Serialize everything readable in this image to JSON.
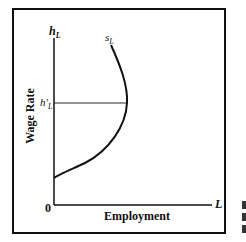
{
  "diagram": {
    "y_axis": {
      "symbol": "h",
      "subscript": "L",
      "label": "Wage Rate"
    },
    "x_axis": {
      "symbol": "L",
      "label": "Employment"
    },
    "origin": "0",
    "curve": {
      "symbol": "s",
      "subscript": "L",
      "shape": "backward-bending supply curve"
    },
    "reference_level": {
      "symbol": "h′",
      "subscript": "L"
    }
  },
  "colors": {
    "ink": "#111111",
    "background": "#ffffff"
  }
}
